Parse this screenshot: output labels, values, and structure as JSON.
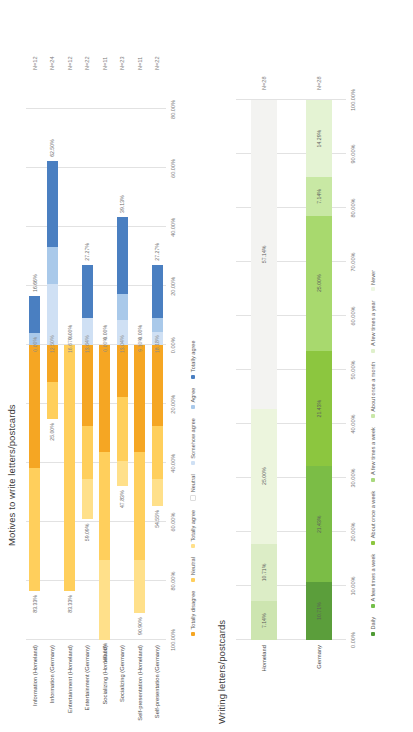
{
  "charts": [
    {
      "id": "motives",
      "title": "Motives to write letters/postcards",
      "type": "bar",
      "subtype": "diverging-stacked",
      "axis_ticks": [
        "100.00%",
        "80.00%",
        "60.00%",
        "40.00%",
        "20.00%",
        "0.00%",
        "20.00%",
        "40.00%",
        "60.00%",
        "80.00%"
      ],
      "axis_values": [
        -100,
        -80,
        -60,
        -40,
        -20,
        0,
        20,
        40,
        60,
        80
      ],
      "xlim": [
        -100,
        90
      ],
      "ylabel": "",
      "xlabel": "",
      "grid": true,
      "legend_position": "bottom",
      "legend": [
        {
          "label": "Totally disagree",
          "color": "#f5a623"
        },
        {
          "label": "Neutral",
          "color": "#ffcf5c"
        },
        {
          "label": "Totally agree",
          "color": "#ffe08a"
        },
        {
          "label": "Neutral",
          "color": "#ffffff"
        },
        {
          "label": "Somehow agree",
          "color": "#cfe0f4"
        },
        {
          "label": "Agree",
          "color": "#a9c9ea"
        },
        {
          "label": "Totally agree",
          "color": "#4a7fc1"
        }
      ],
      "categories": [
        "Information (Homeland)",
        "Information (Germany)",
        "Entertainment (Homeland)",
        "Entertainment (Germany)",
        "Socializing (Homeland)",
        "Socializing (Germany)",
        "Self-presentation (Homeland)",
        "Self-presentation (Germany)"
      ],
      "n_labels": [
        "N=12",
        "N=24",
        "N=12",
        "N=22",
        "N=11",
        "N=23",
        "N=11",
        "N=22"
      ],
      "left_labels": [
        "83.33%",
        "25.00%",
        "83.33%",
        "59.09%",
        "100.00%",
        "47.83%",
        "90.90%",
        "54.55%"
      ],
      "mid_labels": [
        "0.00%",
        "12.50%",
        "16.67%",
        "13.64%",
        "0.00%",
        "13.04%",
        "9.10%",
        "18.18%"
      ],
      "right_labels": [
        "16.66%",
        "62.50%",
        "0.00%",
        "27.27%",
        "0.00%",
        "39.13%",
        "0.00%",
        "27.27%"
      ],
      "rows": [
        {
          "neg": [
            {
              "name": "Totally disagree",
              "value": 41.67,
              "color": "#f5a623"
            },
            {
              "name": "Neutral",
              "value": 41.66,
              "color": "#ffcf5c"
            },
            {
              "name": "Totally agree",
              "value": 0,
              "color": "#ffe08a"
            }
          ],
          "pos": [
            {
              "name": "Neutral",
              "value": 0,
              "color": "#ffffff"
            },
            {
              "name": "Somehow agree",
              "value": 0,
              "color": "#cfe0f4"
            },
            {
              "name": "Agree",
              "value": 4,
              "color": "#a9c9ea"
            },
            {
              "name": "Totally agree",
              "value": 12.66,
              "color": "#4a7fc1"
            }
          ]
        },
        {
          "neg": [
            {
              "name": "Totally disagree",
              "value": 12.5,
              "color": "#f5a623"
            },
            {
              "name": "Neutral",
              "value": 12.5,
              "color": "#ffcf5c"
            },
            {
              "name": "Totally agree",
              "value": 0,
              "color": "#ffe08a"
            }
          ],
          "pos": [
            {
              "name": "Neutral",
              "value": 0,
              "color": "#ffffff"
            },
            {
              "name": "Somehow agree",
              "value": 20.83,
              "color": "#cfe0f4"
            },
            {
              "name": "Agree",
              "value": 12.5,
              "color": "#a9c9ea"
            },
            {
              "name": "Totally agree",
              "value": 29.17,
              "color": "#4a7fc1"
            }
          ]
        },
        {
          "neg": [
            {
              "name": "Totally disagree",
              "value": 0,
              "color": "#f5a623"
            },
            {
              "name": "Neutral",
              "value": 83.33,
              "color": "#ffcf5c"
            },
            {
              "name": "Totally agree",
              "value": 0,
              "color": "#ffe08a"
            }
          ],
          "pos": [
            {
              "name": "Neutral",
              "value": 0,
              "color": "#ffffff"
            },
            {
              "name": "Somehow agree",
              "value": 0,
              "color": "#cfe0f4"
            },
            {
              "name": "Agree",
              "value": 0,
              "color": "#a9c9ea"
            },
            {
              "name": "Totally agree",
              "value": 0,
              "color": "#4a7fc1"
            }
          ]
        },
        {
          "neg": [
            {
              "name": "Totally disagree",
              "value": 27.27,
              "color": "#f5a623"
            },
            {
              "name": "Neutral",
              "value": 18.18,
              "color": "#ffcf5c"
            },
            {
              "name": "Totally agree",
              "value": 13.64,
              "color": "#ffe08a"
            }
          ],
          "pos": [
            {
              "name": "Neutral",
              "value": 0,
              "color": "#ffffff"
            },
            {
              "name": "Somehow agree",
              "value": 9.09,
              "color": "#cfe0f4"
            },
            {
              "name": "Agree",
              "value": 0,
              "color": "#a9c9ea"
            },
            {
              "name": "Totally agree",
              "value": 18.18,
              "color": "#4a7fc1"
            }
          ]
        },
        {
          "neg": [
            {
              "name": "Totally disagree",
              "value": 36.36,
              "color": "#f5a623"
            },
            {
              "name": "Neutral",
              "value": 36.37,
              "color": "#ffcf5c"
            },
            {
              "name": "Totally agree",
              "value": 27.27,
              "color": "#ffe08a"
            }
          ],
          "pos": [
            {
              "name": "Neutral",
              "value": 0,
              "color": "#ffffff"
            },
            {
              "name": "Somehow agree",
              "value": 0,
              "color": "#cfe0f4"
            },
            {
              "name": "Agree",
              "value": 0,
              "color": "#a9c9ea"
            },
            {
              "name": "Totally agree",
              "value": 0,
              "color": "#4a7fc1"
            }
          ]
        },
        {
          "neg": [
            {
              "name": "Totally disagree",
              "value": 17.39,
              "color": "#f5a623"
            },
            {
              "name": "Neutral",
              "value": 21.74,
              "color": "#ffcf5c"
            },
            {
              "name": "Totally agree",
              "value": 8.7,
              "color": "#ffe08a"
            }
          ],
          "pos": [
            {
              "name": "Neutral",
              "value": 0,
              "color": "#ffffff"
            },
            {
              "name": "Somehow agree",
              "value": 8.7,
              "color": "#cfe0f4"
            },
            {
              "name": "Agree",
              "value": 8.69,
              "color": "#a9c9ea"
            },
            {
              "name": "Totally agree",
              "value": 26.09,
              "color": "#4a7fc1"
            }
          ]
        },
        {
          "neg": [
            {
              "name": "Totally disagree",
              "value": 36.36,
              "color": "#f5a623"
            },
            {
              "name": "Neutral",
              "value": 36.36,
              "color": "#ffcf5c"
            },
            {
              "name": "Totally agree",
              "value": 18.18,
              "color": "#ffe08a"
            }
          ],
          "pos": [
            {
              "name": "Neutral",
              "value": 0,
              "color": "#ffffff"
            },
            {
              "name": "Somehow agree",
              "value": 0,
              "color": "#cfe0f4"
            },
            {
              "name": "Agree",
              "value": 0,
              "color": "#a9c9ea"
            },
            {
              "name": "Totally agree",
              "value": 0,
              "color": "#4a7fc1"
            }
          ]
        },
        {
          "neg": [
            {
              "name": "Totally disagree",
              "value": 27.27,
              "color": "#f5a623"
            },
            {
              "name": "Neutral",
              "value": 18.19,
              "color": "#ffcf5c"
            },
            {
              "name": "Totally agree",
              "value": 9.09,
              "color": "#ffe08a"
            }
          ],
          "pos": [
            {
              "name": "Neutral",
              "value": 0,
              "color": "#ffffff"
            },
            {
              "name": "Somehow agree",
              "value": 4.55,
              "color": "#cfe0f4"
            },
            {
              "name": "Agree",
              "value": 4.54,
              "color": "#a9c9ea"
            },
            {
              "name": "Totally agree",
              "value": 18.18,
              "color": "#4a7fc1"
            }
          ]
        }
      ]
    },
    {
      "id": "writing",
      "title": "Writing letters/postcards",
      "type": "bar",
      "subtype": "stacked-100",
      "axis_ticks": [
        "0.00%",
        "10.00%",
        "20.00%",
        "30.00%",
        "40.00%",
        "50.00%",
        "60.00%",
        "70.00%",
        "80.00%",
        "90.00%",
        "100.00%"
      ],
      "axis_values": [
        0,
        10,
        20,
        30,
        40,
        50,
        60,
        70,
        80,
        90,
        100
      ],
      "xlim": [
        0,
        100
      ],
      "grid": true,
      "legend_position": "bottom",
      "legend": [
        {
          "label": "Daily",
          "color": "#4f9b35"
        },
        {
          "label": "A few times a week",
          "color": "#74bf4a"
        },
        {
          "label": "About once a week",
          "color": "#8cc63f"
        },
        {
          "label": "A few times a week",
          "color": "#a9d97e"
        },
        {
          "label": "About once a month",
          "color": "#c9e7a8"
        },
        {
          "label": "A few times a year",
          "color": "#dff0cb"
        },
        {
          "label": "Never",
          "color": "#eef7e3"
        }
      ],
      "categories": [
        "Homeland",
        "Germany"
      ],
      "n_labels": [
        "N=28",
        "N=28"
      ],
      "rows": [
        {
          "segs": [
            {
              "name": "Daily",
              "value": 7.14,
              "color": "#cde5b0",
              "label": "7.14%"
            },
            {
              "name": "A few times a week",
              "value": 10.71,
              "color": "#dcedc6",
              "label": "10.71%"
            },
            {
              "name": "About once a week",
              "value": 25.0,
              "color": "#ecf5dd",
              "label": "25.00%"
            },
            {
              "name": "A few times a month",
              "value": 57.14,
              "color": "#f3f3f1",
              "label": "57.14%"
            }
          ]
        },
        {
          "segs": [
            {
              "name": "Daily",
              "value": 10.71,
              "color": "#5b9e3b",
              "label": "10.71%"
            },
            {
              "name": "A few times a week",
              "value": 21.43,
              "color": "#7bbd46",
              "label": "21.43%"
            },
            {
              "name": "About once a week",
              "value": 21.43,
              "color": "#8cc63f",
              "label": "21.43%"
            },
            {
              "name": "A few times a month",
              "value": 25.0,
              "color": "#a8d96e",
              "label": "25.00%"
            },
            {
              "name": "About once a month",
              "value": 7.14,
              "color": "#c8e8a4",
              "label": "7.14%"
            },
            {
              "name": "A few times a year",
              "value": 14.29,
              "color": "#e4f3d3",
              "label": "14.29%"
            }
          ]
        }
      ]
    }
  ]
}
